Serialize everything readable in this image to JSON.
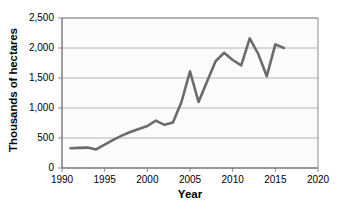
{
  "chart_data": {
    "type": "line",
    "title": "",
    "xlabel": "Year",
    "ylabel": "Thousands of hectares",
    "xlim": [
      1990,
      2020
    ],
    "ylim": [
      0,
      2500
    ],
    "xticks": [
      1990,
      1995,
      2000,
      2005,
      2010,
      2015,
      2020
    ],
    "xtick_labels": [
      "1990",
      "1995",
      "2000",
      "2005",
      "2010",
      "2015",
      "2020"
    ],
    "yticks": [
      0,
      500,
      1000,
      1500,
      2000,
      2500
    ],
    "ytick_labels": [
      "0",
      "500",
      "1,000",
      "1,500",
      "2,000",
      "2,500"
    ],
    "grid": "horizontal",
    "legend": "none",
    "line_color": "#6b6b6b",
    "line_width": 2.6,
    "plot_background": "#fbfbfb",
    "grid_color": "#b4b4b4",
    "axis_color": "#8c8c8c",
    "series": [
      {
        "name": "Area",
        "x": [
          1991,
          1992,
          1993,
          1994,
          1995,
          1996,
          1997,
          1998,
          1999,
          2000,
          2001,
          2002,
          2003,
          2004,
          2005,
          2006,
          2007,
          2008,
          2009,
          2010,
          2011,
          2012,
          2013,
          2014,
          2015,
          2016
        ],
        "values": [
          330,
          335,
          340,
          310,
          390,
          470,
          540,
          600,
          650,
          700,
          790,
          720,
          760,
          1100,
          1610,
          1100,
          1440,
          1780,
          1920,
          1800,
          1710,
          2160,
          1900,
          1530,
          2060,
          2000
        ]
      }
    ]
  }
}
